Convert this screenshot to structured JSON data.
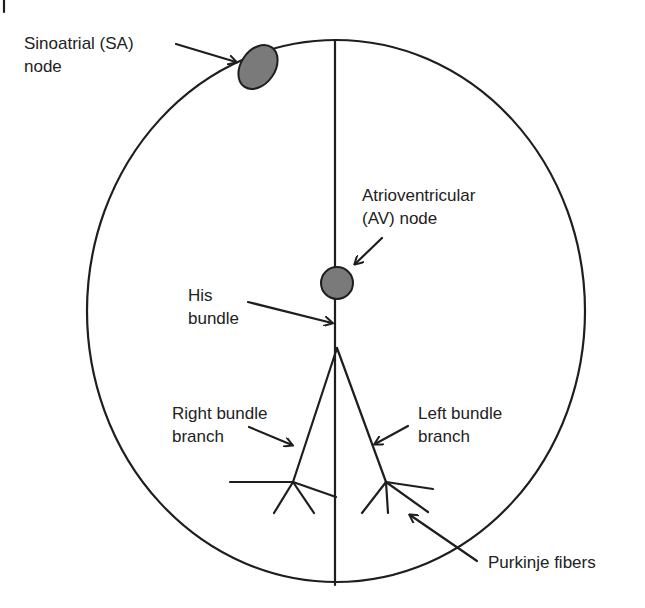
{
  "diagram": {
    "colors": {
      "line": "#1e1e1e",
      "node_fill": "#7a7a7a",
      "text": "#222222",
      "background": "#ffffff"
    },
    "labels": {
      "sa_line1": "Sinoatrial (SA)",
      "sa_line2": "node",
      "av_line1": "Atrioventricular",
      "av_line2": "(AV) node",
      "his_line1": "His",
      "his_line2": "bundle",
      "rbb_line1": "Right bundle",
      "rbb_line2": "branch",
      "lbb_line1": "Left bundle",
      "lbb_line2": "branch",
      "purkinje": "Purkinje fibers"
    },
    "nodes": [
      {
        "name": "Sinoatrial (SA) node",
        "shape": "ellipse"
      },
      {
        "name": "Atrioventricular (AV) node",
        "shape": "circle"
      }
    ]
  }
}
